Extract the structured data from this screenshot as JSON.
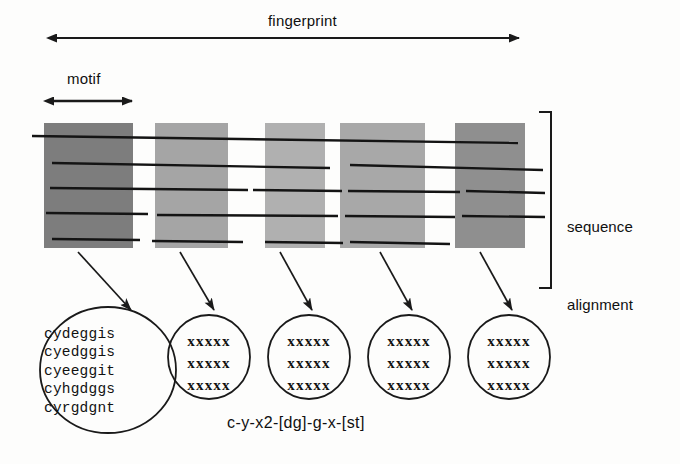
{
  "figure": {
    "title_labels": {
      "fingerprint": "fingerprint",
      "motif": "motif",
      "sequence_alignment_line1": "sequence",
      "sequence_alignment_line2": "alignment"
    },
    "pattern": "c-y-x2-[dg]-g-x-[st]"
  },
  "motif_blocks": [
    {
      "id": "motif-block-1",
      "x": 44,
      "y": 123,
      "width": 89,
      "height": 125,
      "fill": "#7d7d7d"
    },
    {
      "id": "motif-block-2",
      "x": 155,
      "y": 123,
      "width": 73,
      "height": 125,
      "fill": "#a5a5a5"
    },
    {
      "id": "motif-block-3",
      "x": 265,
      "y": 123,
      "width": 60,
      "height": 125,
      "fill": "#b0b0b0"
    },
    {
      "id": "motif-block-4",
      "x": 340,
      "y": 123,
      "width": 85,
      "height": 125,
      "fill": "#a8a8a8"
    },
    {
      "id": "motif-block-5",
      "x": 455,
      "y": 123,
      "width": 70,
      "height": 125,
      "fill": "#8f8f8f"
    }
  ],
  "sequence_lines": [
    {
      "id": "sequence-line-1",
      "segments": [
        [
          32,
          136,
          518,
          143
        ]
      ]
    },
    {
      "id": "sequence-line-2",
      "segments": [
        [
          52,
          163,
          330,
          168
        ],
        [
          350,
          165,
          543,
          170
        ]
      ]
    },
    {
      "id": "sequence-line-3",
      "segments": [
        [
          50,
          188,
          248,
          190
        ],
        [
          253,
          190,
          342,
          191
        ],
        [
          348,
          191,
          460,
          192
        ],
        [
          466,
          191,
          545,
          193
        ]
      ]
    },
    {
      "id": "sequence-line-4",
      "segments": [
        [
          46,
          213,
          148,
          214
        ],
        [
          157,
          215,
          338,
          216
        ],
        [
          345,
          216,
          455,
          217
        ],
        [
          462,
          216,
          545,
          217
        ]
      ]
    },
    {
      "id": "sequence-line-5",
      "segments": [
        [
          52,
          239,
          140,
          240
        ],
        [
          152,
          241,
          243,
          242
        ],
        [
          265,
          242,
          343,
          243
        ],
        [
          350,
          242,
          450,
          244
        ]
      ]
    }
  ],
  "arrows": {
    "fingerprint_arrow": {
      "x1": 55,
      "y1": 38,
      "x2": 520,
      "y2": 38
    },
    "motif_arrow": {
      "x1": 52,
      "y1": 101,
      "x2": 133,
      "y2": 101
    },
    "connector_arrows": [
      {
        "id": "connector-arrow-1",
        "x1": 78,
        "y1": 252,
        "x2": 133,
        "y2": 312
      },
      {
        "id": "connector-arrow-2",
        "x1": 178,
        "y1": 252,
        "x2": 216,
        "y2": 312
      },
      {
        "id": "connector-arrow-3",
        "x1": 278,
        "y1": 252,
        "x2": 313,
        "y2": 312
      },
      {
        "id": "connector-arrow-4",
        "x1": 378,
        "y1": 252,
        "x2": 413,
        "y2": 312
      },
      {
        "id": "connector-arrow-5",
        "x1": 478,
        "y1": 252,
        "x2": 513,
        "y2": 312
      }
    ]
  },
  "bracket": {
    "x": 551,
    "top": 112,
    "bottom": 288,
    "tick": 12
  },
  "circles": [
    {
      "id": "motif-detail-circle-1",
      "cx": 108,
      "cy": 370,
      "rx": 67,
      "ry": 62,
      "lines": [
        "cydeggis",
        "cyedggis",
        "cyeeggit",
        "cyhgdggs",
        "cyrgdgnt"
      ]
    },
    {
      "id": "motif-detail-circle-2",
      "cx": 209,
      "cy": 356,
      "rx": 40,
      "ry": 41,
      "lines": [
        "xxxxx",
        "xxxxx",
        "xxxxx"
      ]
    },
    {
      "id": "motif-detail-circle-3",
      "cx": 309,
      "cy": 356,
      "rx": 40,
      "ry": 41,
      "lines": [
        "xxxxx",
        "xxxxx",
        "xxxxx"
      ]
    },
    {
      "id": "motif-detail-circle-4",
      "cx": 409,
      "cy": 356,
      "rx": 40,
      "ry": 41,
      "lines": [
        "xxxxx",
        "xxxxx",
        "xxxxx"
      ]
    },
    {
      "id": "motif-detail-circle-5",
      "cx": 509,
      "cy": 356,
      "rx": 40,
      "ry": 41,
      "lines": [
        "xxxxx",
        "xxxxx",
        "xxxxx"
      ]
    }
  ],
  "colors": {
    "stroke": "#1a1a1a",
    "background": "#fdfdfc"
  },
  "circle_text": {
    "c1": "cydeggis\ncyedggis\ncyeeggit\ncyhgdggs\ncyrgdgnt",
    "c2": "xxxxx\nxxxxx\nxxxxx",
    "c3": "xxxxx\nxxxxx\nxxxxx",
    "c4": "xxxxx\nxxxxx\nxxxxx",
    "c5": "xxxxx\nxxxxx\nxxxxx"
  }
}
